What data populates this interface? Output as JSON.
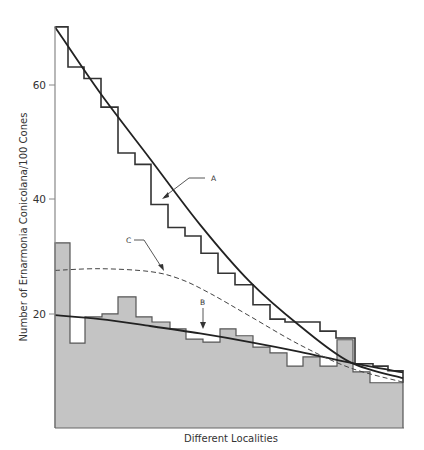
{
  "chart_data": {
    "type": "bar",
    "title": "",
    "xlabel": "Different Localities",
    "ylabel": "Number of Ernarmonia Conicolana/100 Cones",
    "yticks": [
      20,
      40,
      60
    ],
    "ylim": [
      0,
      72
    ],
    "grid": false,
    "legend": "none (curves labelled by annotations A, B, C)",
    "upper_histogram": {
      "name": "Upper step histogram (unshaded)",
      "bins_px": [
        [
          55,
          68
        ],
        [
          68,
          84
        ],
        [
          84,
          101
        ],
        [
          101,
          118
        ],
        [
          118,
          135
        ],
        [
          135,
          151
        ],
        [
          151,
          168
        ],
        [
          168,
          185
        ],
        [
          185,
          201
        ],
        [
          201,
          218
        ],
        [
          218,
          235
        ],
        [
          235,
          253
        ],
        [
          253,
          270
        ],
        [
          270,
          285
        ],
        [
          285,
          320
        ],
        [
          320,
          336
        ],
        [
          336,
          355
        ],
        [
          355,
          373
        ],
        [
          373,
          388
        ],
        [
          388,
          403
        ]
      ],
      "values": [
        70,
        63,
        61,
        56,
        48,
        46,
        39,
        35,
        33.5,
        30.5,
        27,
        25,
        21.5,
        19,
        18.5,
        16.9,
        15.7,
        11.2,
        10.8,
        10
      ]
    },
    "lower_histogram": {
      "name": "Lower shaded histogram",
      "bins_px": [
        [
          55,
          70
        ],
        [
          70,
          85
        ],
        [
          85,
          102
        ],
        [
          102,
          118
        ],
        [
          118,
          136
        ],
        [
          136,
          152
        ],
        [
          152,
          170
        ],
        [
          170,
          186
        ],
        [
          186,
          203
        ],
        [
          203,
          220
        ],
        [
          220,
          236
        ],
        [
          236,
          253
        ],
        [
          253,
          270
        ],
        [
          270,
          287
        ],
        [
          287,
          303
        ],
        [
          303,
          320
        ],
        [
          320,
          337
        ],
        [
          337,
          353
        ],
        [
          353,
          370
        ],
        [
          370,
          403
        ]
      ],
      "values": [
        32.3,
        14.8,
        19.4,
        19.9,
        22.9,
        19.4,
        18.5,
        17.3,
        15.5,
        15.0,
        17.3,
        16.1,
        14.1,
        13.1,
        10.8,
        12.4,
        10.8,
        15.4,
        9.8,
        7.9
      ]
    },
    "series": [
      {
        "name": "A",
        "style": "solid",
        "description": "Fitted curve through upper histogram",
        "x_px": [
          55,
          100,
          150,
          200,
          250,
          300,
          350,
          403
        ],
        "values": [
          70,
          58.5,
          47,
          35.5,
          25.5,
          17.8,
          11.5,
          8.7
        ]
      },
      {
        "name": "B",
        "style": "solid",
        "description": "Fitted curve through shaded histogram",
        "x_px": [
          55,
          100,
          150,
          200,
          250,
          300,
          350,
          403
        ],
        "values": [
          19.7,
          19.0,
          17.8,
          16.5,
          15.0,
          13.3,
          11.4,
          9.7
        ]
      },
      {
        "name": "C",
        "style": "dashed",
        "description": "Dashed curve",
        "x_px": [
          55,
          100,
          150,
          180,
          210,
          250,
          300,
          350,
          403
        ],
        "values": [
          27.5,
          27.8,
          27.3,
          26.0,
          23.5,
          19.5,
          14.5,
          10.5,
          8.0
        ]
      }
    ],
    "annotations": [
      {
        "label": "A",
        "points_to": "curve A"
      },
      {
        "label": "B",
        "points_to": "curve B"
      },
      {
        "label": "C",
        "points_to": "curve C"
      }
    ]
  },
  "axes": {
    "x_label": "Different Localities",
    "y_label": "Number of Ernarmonia Conicolana/100 Cones",
    "y_tick_labels": [
      "20",
      "40",
      "60"
    ]
  },
  "annotations": {
    "a": "A",
    "b": "B",
    "c": "C"
  },
  "colors": {
    "shade": "#c4c4c4",
    "line": "#2b2b2b",
    "axis": "#888888"
  }
}
